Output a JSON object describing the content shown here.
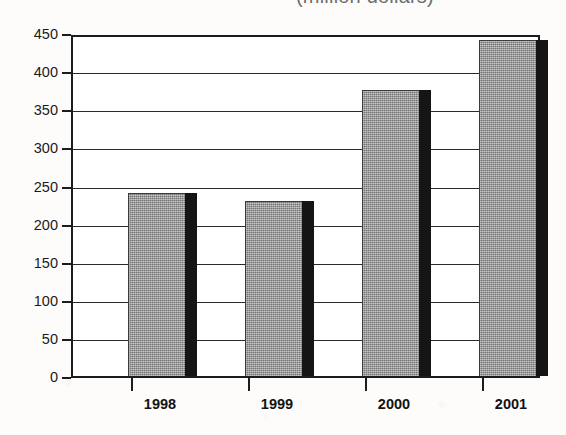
{
  "chart_data": {
    "type": "bar",
    "title": "(million dollars)",
    "xlabel": "",
    "ylabel": "",
    "categories": [
      "1998",
      "1999",
      "2000",
      "2001"
    ],
    "values": [
      242,
      231,
      377,
      443
    ],
    "ylim": [
      0,
      450
    ],
    "ytick_labels": [
      "450",
      "400",
      "350",
      "300",
      "250",
      "200",
      "150",
      "100",
      "50",
      "0"
    ],
    "ytick_values": [
      450,
      400,
      350,
      300,
      250,
      200,
      150,
      100,
      50,
      0
    ],
    "ystep": 50,
    "grid": true,
    "gridlines_horizontal": true,
    "legend": false,
    "legend_position": "none",
    "series": [
      {
        "name": "Value",
        "values": [
          242,
          231,
          377,
          443
        ]
      }
    ],
    "annotations": [],
    "colors": {
      "bar_face": "#8e8e8e",
      "bar_shadow": "#151515",
      "axis": "#1c1c1c",
      "gridline": "#2a2a2a",
      "label_text": "#121212",
      "title_text": "#6d6d6d",
      "plot_background": "#ffffff",
      "page_background": "#fdfcfb"
    },
    "style_notes": "3D-effect bars: dithered grey front face with solid black right side panel; horizontal gridlines span full plot width; title clipped by top image edge"
  }
}
